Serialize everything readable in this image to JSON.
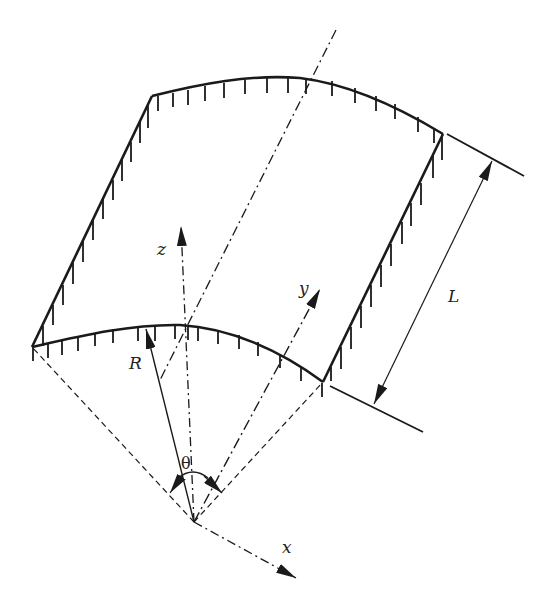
{
  "diagram": {
    "type": "cylindrical-shell-panel",
    "colors": {
      "stroke": "#1a1a1a",
      "background": "#ffffff"
    },
    "labels": {
      "z_axis": "z",
      "y_axis": "y",
      "x_axis": "x",
      "radius": "R",
      "angle": "θ",
      "length": "L"
    },
    "edges": {
      "top_curved": "clamped",
      "bottom_curved": "clamped",
      "left_straight": "clamped",
      "right_straight": "clamped"
    },
    "components": [
      "shell-panel-outline",
      "support-hatch-marks",
      "coordinate-axes",
      "radius-arrow",
      "angle-arc",
      "length-dimension",
      "center-axis",
      "dashed-radial-lines"
    ]
  }
}
